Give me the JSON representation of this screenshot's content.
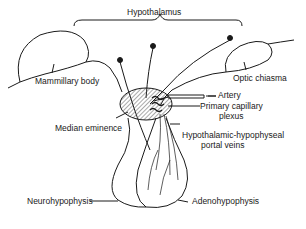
{
  "diagram": {
    "title": "Hypothalamus",
    "labels": {
      "hypothalamus": "Hypothalamus",
      "mammillary_body": "Mammillary body",
      "optic_chiasma": "Optic chiasma",
      "artery": "Artery",
      "primary_capillary_plexus_line1": "Primary capillary",
      "primary_capillary_plexus_line2": "plexus",
      "median_eminence": "Median eminence",
      "portal_veins_line1": "Hypothalamic-hypophyseal",
      "portal_veins_line2": "portal veins",
      "neurohypophysis": "Neurohypophysis",
      "adenohypophysis": "Adenohypophysis"
    },
    "colors": {
      "line": "#1a1a1a",
      "background": "#ffffff"
    }
  }
}
